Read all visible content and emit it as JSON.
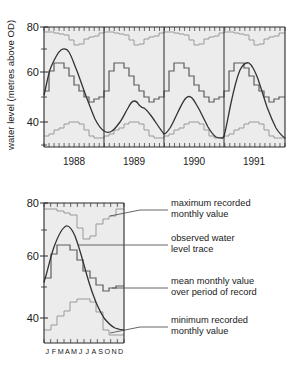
{
  "figure": {
    "title": "",
    "panels": [
      "top-timeseries",
      "bottom-annual-cycle"
    ]
  },
  "colors": {
    "axis": "#2b2b2b",
    "plot_background": "#ececec",
    "max_line": "#9a9a9a",
    "min_line": "#9a9a9a",
    "mean_line": "#5c5c5c",
    "observed_line": "#333333",
    "text": "#1a1a1a",
    "leader_line": "#555555"
  },
  "top_chart": {
    "ylabel": "water level (metres above OD)",
    "ytick_labels": [
      "80",
      "60",
      "40"
    ],
    "xtick_labels": [
      "1988",
      "1989",
      "1990",
      "1991"
    ]
  },
  "bottom_chart": {
    "ytick_labels": [
      "80",
      "60",
      "40"
    ],
    "month_labels": [
      "J",
      "F",
      "M",
      "A",
      "M",
      "J",
      "J",
      "A",
      "S",
      "O",
      "N",
      "D"
    ],
    "month_strip": "J FMAMJ J ASOND"
  },
  "annotations": [
    {
      "id": "annotation-maximum",
      "line1": "maximum recorded",
      "line2": "monthly value"
    },
    {
      "id": "annotation-observed",
      "line1": "observed water",
      "line2": "level trace"
    },
    {
      "id": "annotation-mean",
      "line1": "mean monthly value",
      "line2": "over period of record"
    },
    {
      "id": "annotation-minimum",
      "line1": "minimum recorded",
      "line2": "monthly value"
    }
  ],
  "chart_data": [
    {
      "type": "line",
      "id": "top-timeseries",
      "title": "",
      "xlabel": "",
      "ylabel": "water level (metres above OD)",
      "ylim": [
        30,
        80
      ],
      "yticks": [
        40,
        60,
        80
      ],
      "grid": false,
      "legend": "none",
      "x_category_labels": [
        "1988",
        "1989",
        "1990",
        "1991"
      ],
      "x_minor_ticks": "monthly",
      "months": [
        "J",
        "F",
        "M",
        "A",
        "M",
        "J",
        "J",
        "A",
        "S",
        "O",
        "N",
        "D"
      ],
      "series": [
        {
          "name": "maximum recorded monthly value",
          "style": "step",
          "color": "#9a9a9a",
          "values_1988": [
            77.5,
            77.5,
            77.0,
            76.5,
            76.0,
            74.0,
            72.0,
            72.5,
            74.5,
            75.0,
            75.5,
            77.0
          ],
          "values_1989": [
            77.5,
            77.5,
            77.0,
            76.5,
            76.0,
            74.0,
            72.0,
            72.5,
            74.5,
            75.0,
            75.5,
            77.0
          ],
          "values_1990": [
            77.5,
            77.5,
            77.0,
            76.5,
            76.0,
            74.0,
            72.0,
            72.5,
            74.5,
            75.0,
            75.5,
            77.0
          ],
          "values_1991": [
            77.5,
            77.5,
            77.0,
            76.5,
            76.0,
            74.0,
            72.0,
            72.5,
            74.5,
            75.0,
            75.5,
            77.0
          ]
        },
        {
          "name": "mean monthly value over period of record",
          "style": "step",
          "color": "#5c5c5c",
          "values_1988": [
            52.0,
            60.5,
            63.5,
            63.5,
            62.0,
            58.5,
            55.0,
            52.5,
            50.0,
            48.0,
            49.0,
            49.5
          ],
          "values_1989": [
            52.0,
            60.5,
            63.5,
            63.5,
            62.0,
            58.5,
            55.0,
            52.5,
            50.0,
            48.0,
            49.0,
            49.5
          ],
          "values_1990": [
            52.0,
            60.5,
            63.5,
            63.5,
            62.0,
            58.5,
            55.0,
            52.5,
            50.0,
            48.0,
            49.0,
            49.5
          ],
          "values_1991": [
            52.0,
            60.5,
            63.5,
            63.5,
            62.0,
            58.5,
            55.0,
            52.5,
            50.0,
            48.0,
            49.0,
            49.5
          ]
        },
        {
          "name": "minimum recorded monthly value",
          "style": "step",
          "color": "#9a9a9a",
          "values_1988": [
            33.5,
            34.5,
            36.0,
            37.0,
            38.5,
            39.5,
            39.5,
            38.5,
            36.0,
            33.5,
            32.5,
            32.5
          ],
          "values_1989": [
            33.5,
            34.5,
            36.0,
            37.0,
            38.5,
            39.5,
            39.5,
            38.5,
            36.0,
            33.5,
            32.5,
            32.5
          ],
          "values_1990": [
            33.5,
            34.5,
            36.0,
            37.0,
            38.5,
            39.5,
            39.5,
            38.5,
            36.0,
            33.5,
            32.5,
            32.5
          ],
          "values_1991": [
            33.5,
            34.5,
            36.0,
            37.0,
            38.5,
            39.5,
            39.5,
            38.5,
            36.0,
            33.5,
            32.5,
            32.5
          ]
        },
        {
          "name": "observed water level trace",
          "style": "smooth",
          "color": "#333333",
          "values_1988": [
            50.5,
            62.0,
            69.0,
            71.5,
            69.5,
            64.5,
            58.0,
            51.0,
            45.0,
            40.5,
            37.0,
            35.0
          ],
          "values_1989": [
            34.5,
            36.0,
            38.5,
            41.0,
            45.0,
            43.5,
            43.0,
            41.0,
            38.0,
            35.5,
            33.5,
            32.5
          ],
          "values_1990": [
            33.0,
            35.0,
            38.5,
            42.5,
            45.5,
            46.0,
            44.0,
            41.0,
            38.0,
            35.0,
            33.0,
            31.5
          ],
          "values_1991": [
            33.0,
            45.0,
            56.0,
            61.0,
            62.0,
            60.5,
            56.0,
            50.0,
            44.0,
            38.5,
            35.0,
            32.5
          ]
        }
      ]
    },
    {
      "type": "line",
      "id": "bottom-annual-cycle",
      "title": "",
      "xlabel": "",
      "ylabel": "",
      "ylim": [
        30,
        80
      ],
      "yticks": [
        40,
        60,
        80
      ],
      "grid": false,
      "legend": "annotations-with-leader-lines",
      "categories": [
        "J",
        "F",
        "M",
        "A",
        "M",
        "J",
        "J",
        "A",
        "S",
        "O",
        "N",
        "D"
      ],
      "series": [
        {
          "name": "maximum recorded monthly value",
          "style": "step",
          "color": "#9a9a9a",
          "values": [
            77.5,
            77.5,
            77.0,
            76.5,
            76.0,
            74.0,
            72.0,
            72.5,
            74.5,
            75.0,
            75.5,
            77.0
          ]
        },
        {
          "name": "observed water level trace",
          "style": "smooth",
          "color": "#333333",
          "values": [
            50.5,
            62.0,
            69.0,
            71.5,
            69.5,
            64.5,
            58.0,
            51.0,
            45.0,
            40.5,
            37.0,
            35.5
          ]
        },
        {
          "name": "mean monthly value over period of record",
          "style": "step",
          "color": "#5c5c5c",
          "values": [
            52.0,
            60.5,
            63.5,
            63.5,
            62.0,
            58.5,
            55.0,
            52.5,
            50.0,
            48.0,
            49.0,
            49.5
          ]
        },
        {
          "name": "minimum recorded monthly value",
          "style": "step",
          "color": "#9a9a9a",
          "values": [
            33.5,
            34.5,
            36.0,
            37.0,
            38.5,
            39.5,
            39.5,
            38.5,
            36.0,
            33.5,
            32.5,
            32.5
          ]
        }
      ]
    }
  ]
}
